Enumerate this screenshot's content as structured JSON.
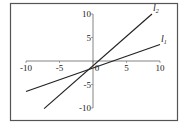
{
  "chart_data": {
    "type": "line",
    "title": "",
    "xlabel": "",
    "ylabel": "",
    "xlim": [
      -10,
      10
    ],
    "ylim": [
      -10,
      10
    ],
    "x_ticks": [
      -10,
      -5,
      0,
      5,
      10
    ],
    "y_ticks": [
      -10,
      -5,
      5,
      10
    ],
    "x_tick_labels": [
      "-10",
      "-5",
      "0",
      "5",
      "10"
    ],
    "y_tick_labels": [
      "-10",
      "-5",
      "5",
      "10"
    ],
    "origin_label": "0",
    "grid": false,
    "legend": "none",
    "series": [
      {
        "name": "l1",
        "label_base": "l",
        "label_sub": "1",
        "slope": 0.5,
        "intercept": -1.5,
        "x_range": [
          -10,
          10
        ],
        "color": "#222222"
      },
      {
        "name": "l2",
        "label_base": "l",
        "label_sub": "2",
        "slope": 1.25,
        "intercept": -1,
        "x_range": [
          -7.3,
          8.8
        ],
        "color": "#222222"
      }
    ]
  }
}
